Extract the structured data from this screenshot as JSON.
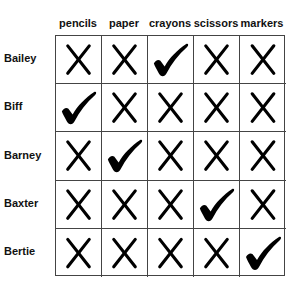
{
  "columns": [
    "pencils",
    "paper",
    "crayons",
    "scissors",
    "markers"
  ],
  "rows": [
    {
      "name": "Bailey",
      "marks": [
        "x",
        "x",
        "check",
        "x",
        "x"
      ]
    },
    {
      "name": "Biff",
      "marks": [
        "check",
        "x",
        "x",
        "x",
        "x"
      ]
    },
    {
      "name": "Barney",
      "marks": [
        "x",
        "check",
        "x",
        "x",
        "x"
      ]
    },
    {
      "name": "Baxter",
      "marks": [
        "x",
        "x",
        "x",
        "check",
        "x"
      ]
    },
    {
      "name": "Bertie",
      "marks": [
        "x",
        "x",
        "x",
        "x",
        "check"
      ]
    }
  ],
  "icons": {
    "x": "x-mark-icon",
    "check": "check-mark-icon"
  },
  "colors": {
    "mark": "#000000",
    "grid": "#444444"
  }
}
